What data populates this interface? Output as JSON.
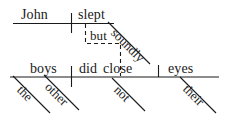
{
  "diagram": {
    "type": "reed-kellogg-sentence-diagram",
    "ink_color": "#1a1a1a",
    "background_color": "#ffffff",
    "clauses": [
      {
        "id": "top-clause",
        "subject": "John",
        "predicate": "slept",
        "modifiers": [
          {
            "word": "soundly",
            "attaches_to": "slept",
            "kind": "adverb"
          }
        ]
      },
      {
        "id": "bottom-clause",
        "subject": "boys",
        "predicate": "did close",
        "object": "eyes",
        "modifiers": [
          {
            "word": "the",
            "attaches_to": "boys",
            "kind": "article"
          },
          {
            "word": "other",
            "attaches_to": "boys",
            "kind": "adjective"
          },
          {
            "word": "not",
            "attaches_to": "did close",
            "kind": "adverb"
          },
          {
            "word": "their",
            "attaches_to": "eyes",
            "kind": "possessive"
          }
        ]
      }
    ],
    "conjunction": {
      "word": "but",
      "style": "dashed-connector",
      "connects": [
        "top-clause",
        "bottom-clause"
      ]
    },
    "words": {
      "john": "John",
      "slept": "slept",
      "soundly": "soundly",
      "but": "but",
      "the": "the",
      "other": "other",
      "boys": "boys",
      "did": "did",
      "close": "close",
      "not": "not",
      "their": "their",
      "eyes": "eyes"
    }
  }
}
